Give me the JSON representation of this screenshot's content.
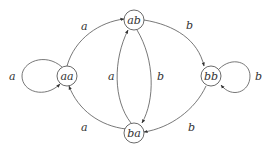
{
  "diagram": {
    "type": "state-transition",
    "nodes": [
      {
        "id": "aa",
        "label": "aa"
      },
      {
        "id": "ab",
        "label": "ab"
      },
      {
        "id": "bb",
        "label": "bb"
      },
      {
        "id": "ba",
        "label": "ba"
      }
    ],
    "edges": [
      {
        "from": "aa",
        "to": "aa",
        "label": "a"
      },
      {
        "from": "aa",
        "to": "ab",
        "label": "a"
      },
      {
        "from": "ab",
        "to": "bb",
        "label": "b"
      },
      {
        "from": "ab",
        "to": "ba",
        "label": "b"
      },
      {
        "from": "ba",
        "to": "ab",
        "label": "a"
      },
      {
        "from": "ba",
        "to": "aa",
        "label": "a"
      },
      {
        "from": "bb",
        "to": "bb",
        "label": "b"
      },
      {
        "from": "bb",
        "to": "ba",
        "label": "b"
      }
    ]
  }
}
